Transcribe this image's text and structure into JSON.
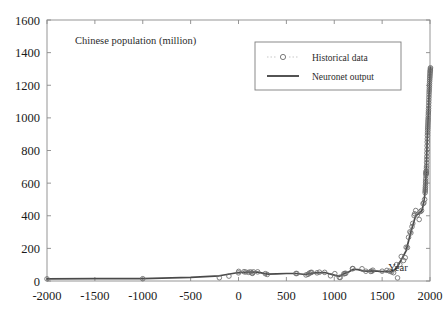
{
  "figure": {
    "background_color": "#ffffff",
    "axes_color": "#8a8a8a",
    "line_color": "#4a4a4a",
    "marker_color": "#6b6b6b",
    "text_color": "#2b2b2b"
  },
  "chart_data": {
    "type": "line",
    "title": "Chinese population (million)",
    "xlabel": "Year",
    "ylabel": "",
    "xlim": [
      -2000,
      2000
    ],
    "ylim": [
      0,
      1600
    ],
    "grid": false,
    "legend_position": "top-right",
    "xticks": [
      -2000,
      -1500,
      -1000,
      -500,
      0,
      500,
      1000,
      1500,
      2000
    ],
    "xticklabels": [
      "-2000",
      "-1500",
      "-1000",
      "-500",
      "0",
      "500",
      "1000",
      "1500",
      "2000"
    ],
    "yticks": [
      0,
      200,
      400,
      600,
      800,
      1000,
      1200,
      1400,
      1600
    ],
    "yticklabels": [
      "0",
      "200",
      "400",
      "600",
      "800",
      "1000",
      "1200",
      "1400",
      "1600"
    ],
    "series": [
      {
        "name": "Historical data",
        "style": "markers",
        "marker": "circle-open",
        "x": [
          -2000,
          -1000,
          -200,
          -100,
          0,
          2,
          57,
          75,
          105,
          125,
          140,
          146,
          156,
          200,
          280,
          300,
          600,
          609,
          705,
          726,
          740,
          755,
          764,
          820,
          845,
          900,
          961,
          1006,
          1053,
          1063,
          1100,
          1110,
          1120,
          1190,
          1195,
          1290,
          1330,
          1381,
          1393,
          1403,
          1500,
          1550,
          1578,
          1600,
          1620,
          1650,
          1661,
          1685,
          1700,
          1724,
          1741,
          1751,
          1764,
          1776,
          1790,
          1800,
          1812,
          1820,
          1834,
          1840,
          1851,
          1868,
          1887,
          1901,
          1912,
          1928,
          1936,
          1944,
          1949,
          1950,
          1951,
          1952,
          1953,
          1954,
          1955,
          1956,
          1957,
          1958,
          1959,
          1960,
          1961,
          1962,
          1963,
          1964,
          1965,
          1966,
          1967,
          1968,
          1969,
          1970,
          1971,
          1972,
          1973,
          1974,
          1975,
          1976,
          1977,
          1978,
          1979,
          1980,
          1981,
          1982,
          1983,
          1984,
          1985,
          1986,
          1987,
          1988,
          1989,
          1990,
          1991,
          1992,
          1993,
          1994,
          1995,
          1996,
          1997,
          1998,
          1999,
          2000,
          2001,
          2002,
          2003,
          2004,
          2005
        ],
        "y": [
          13,
          14,
          20,
          30,
          50,
          59,
          57,
          55,
          53,
          56,
          49,
          47,
          56,
          56,
          45,
          40,
          46,
          46,
          37,
          41,
          48,
          52,
          53,
          50,
          54,
          53,
          32,
          45,
          22,
          22,
          44,
          46,
          47,
          76,
          76,
          75,
          60,
          59,
          60,
          66,
          60,
          65,
          60,
          56,
          51,
          100,
          19,
          101,
          150,
          126,
          143,
          207,
          205,
          268,
          301,
          295,
          333,
          353,
          401,
          412,
          432,
          405,
          377,
          426,
          432,
          474,
          479,
          500,
          541,
          552,
          563,
          574,
          587,
          602,
          614,
          628,
          646,
          659,
          672,
          662,
          658,
          673,
          691,
          704,
          725,
          745,
          763,
          785,
          806,
          829,
          852,
          871,
          892,
          908,
          924,
          937,
          949,
          962,
          975,
          987,
          1000,
          1016,
          1030,
          1043,
          1058,
          1075,
          1093,
          1110,
          1127,
          1143,
          1158,
          1171,
          1185,
          1198,
          1211,
          1224,
          1236,
          1247,
          1257,
          1267,
          1276,
          1285,
          1292,
          1300,
          1307
        ]
      },
      {
        "name": "Neuronet output",
        "style": "line",
        "x": [
          -2000,
          -1500,
          -1000,
          -500,
          -200,
          0,
          100,
          200,
          300,
          400,
          500,
          600,
          700,
          750,
          800,
          900,
          1000,
          1050,
          1100,
          1150,
          1200,
          1250,
          1300,
          1350,
          1400,
          1450,
          1500,
          1550,
          1600,
          1650,
          1700,
          1750,
          1800,
          1850,
          1900,
          1920,
          1940,
          1950,
          1960,
          1970,
          1980,
          1990,
          2000,
          2005
        ],
        "y": [
          13,
          14,
          15,
          22,
          32,
          52,
          55,
          54,
          42,
          44,
          46,
          46,
          40,
          47,
          50,
          52,
          36,
          28,
          45,
          55,
          72,
          70,
          62,
          60,
          62,
          60,
          58,
          60,
          55,
          78,
          130,
          185,
          300,
          400,
          420,
          440,
          500,
          555,
          660,
          850,
          990,
          1150,
          1270,
          1310
        ]
      }
    ]
  },
  "legend": {
    "items": [
      {
        "label": "Historical data",
        "symbol": "circle-open"
      },
      {
        "label": "Neuronet output",
        "symbol": "line"
      }
    ]
  }
}
